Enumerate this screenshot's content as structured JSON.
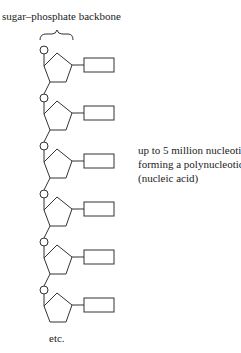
{
  "diagram": {
    "title": "sugar–phosphate backbone",
    "side_label": [
      "up to 5 million nucleotides,",
      "forming a polynucleotide",
      "(nucleic acid)"
    ],
    "footer": "etc.",
    "units": [
      {
        "y": 50
      },
      {
        "y": 98
      },
      {
        "y": 146
      },
      {
        "y": 194
      },
      {
        "y": 242
      },
      {
        "y": 290
      }
    ],
    "stroke_color": "#333333"
  }
}
